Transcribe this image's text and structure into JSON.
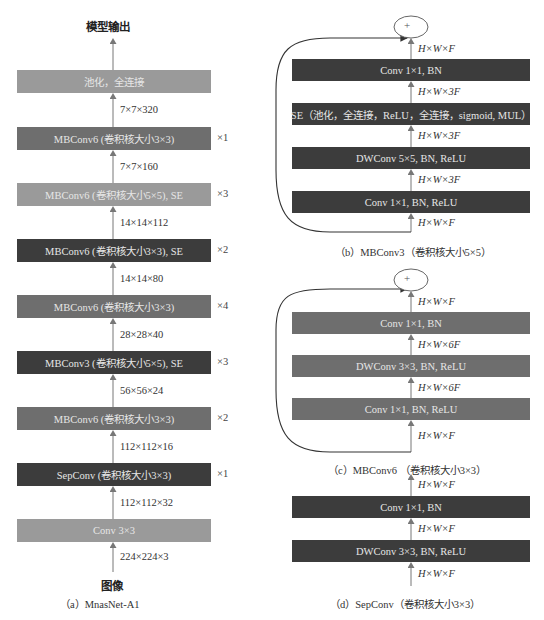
{
  "colors": {
    "light": "#9a9a9a",
    "medium": "#6e6e6e",
    "dark": "#3c3c3c",
    "arrow": "#777777",
    "curve": "#333333"
  },
  "panel_a": {
    "output_label": "模型输出",
    "input_label": "图像",
    "caption": "（a）MnasNet-A1",
    "blocks": [
      {
        "label": "池化，全连接",
        "shade": "light",
        "repeat": ""
      },
      {
        "label": "MBConv6 (卷积核大小3×3)",
        "shade": "medium",
        "repeat": "×1"
      },
      {
        "label": "MBConv6 (卷积核大小5×5), SE",
        "shade": "light",
        "repeat": "×3"
      },
      {
        "label": "MBConv6 (卷积核大小3×3), SE",
        "shade": "dark",
        "repeat": "×2"
      },
      {
        "label": "MBConv6 (卷积核大小3×3)",
        "shade": "medium",
        "repeat": "×4"
      },
      {
        "label": "MBConv3 (卷积核大小5×5), SE",
        "shade": "dark",
        "repeat": "×3"
      },
      {
        "label": "MBConv6 (卷积核大小3×3)",
        "shade": "medium",
        "repeat": "×2"
      },
      {
        "label": "SepConv (卷积核大小3×3)",
        "shade": "dark",
        "repeat": "×1"
      },
      {
        "label": "Conv 3×3",
        "shade": "light",
        "repeat": ""
      }
    ],
    "shapes": [
      "7×7×320",
      "7×7×160",
      "14×14×112",
      "14×14×80",
      "28×28×40",
      "56×56×24",
      "112×112×16",
      "112×112×32",
      "224×224×3"
    ]
  },
  "panel_b": {
    "add_symbol": "+",
    "caption": "（b）MBConv3（卷积核大小5×5）",
    "blocks": [
      {
        "label": "Conv 1×1, BN"
      },
      {
        "label": "SE（池化，全连接，ReLU，全连接，sigmoid, MUL）"
      },
      {
        "label": "DWConv 5×5, BN, ReLU"
      },
      {
        "label": "Conv 1×1, BN, ReLU"
      }
    ],
    "shapes": [
      "H×W×F",
      "H×W×3F",
      "H×W×3F",
      "H×W×3F",
      "H×W×F"
    ]
  },
  "panel_c": {
    "add_symbol": "+",
    "caption": "（c）MBConv6 （卷积核大小3×3）",
    "blocks": [
      {
        "label": "Conv 1×1, BN"
      },
      {
        "label": "DWConv 3×3, BN, ReLU"
      },
      {
        "label": "Conv 1×1, BN, ReLU"
      }
    ],
    "shapes": [
      "H×W×F",
      "H×W×6F",
      "H×W×6F",
      "H×W×F"
    ]
  },
  "panel_d": {
    "caption": "（d）SepConv（卷积核大小3×3）",
    "blocks": [
      {
        "label": "Conv 1×1, BN"
      },
      {
        "label": "DWConv 3×3, BN, ReLU"
      }
    ],
    "shapes": [
      "H×W×F",
      "H×W×F",
      "H×W×F"
    ]
  }
}
